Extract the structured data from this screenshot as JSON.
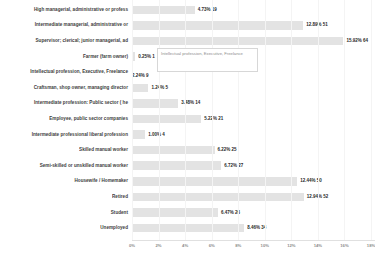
{
  "chart_data": {
    "type": "bar",
    "orientation": "horizontal",
    "title": "",
    "xlabel": "",
    "ylabel": "",
    "xlim": [
      0,
      18
    ],
    "grid": true,
    "legend": null,
    "tick_labels": [
      "0%",
      "2%",
      "4%",
      "6%",
      "8%",
      "10%",
      "12%",
      "14%",
      "16%",
      "18%"
    ],
    "tick_values": [
      0,
      2,
      4,
      6,
      8,
      10,
      12,
      14,
      16,
      18
    ],
    "categories": [
      "High managerial, administrative or profess",
      "Intermediate managerial, administrative or",
      "Supervisor; clerical; junior managerial, ad",
      "Farmer (farm owner)",
      "Intellectual profession, Executive, Freelance",
      "Craftsman, shop owner, managing director",
      "Intermediate profession: Public sector ( he",
      "Employee, public sector companies",
      "Intermediate professional liberal profession",
      "Skilled manual worker",
      "Semi-skilled or unskilled manual worker",
      "Housewife / Homemaker",
      "Retired",
      "Student",
      "Unemployed"
    ],
    "values": [
      4.73,
      12.89,
      15.92,
      0.25,
      2.24,
      1.24,
      3.48,
      5.22,
      1.0,
      6.22,
      6.72,
      12.44,
      12.94,
      6.47,
      8.46
    ],
    "counts": [
      19,
      51,
      64,
      1,
      9,
      5,
      14,
      21,
      4,
      25,
      27,
      50,
      52,
      26,
      34
    ],
    "value_labels": [
      "4.73% 19",
      "12.89% 51",
      "15.92% 64",
      "0.25% 1",
      "2.24% 9",
      "1.24% 5",
      "3.48% 14",
      "5.22% 21",
      "1.00% 4",
      "6.22% 25",
      "6.72% 27",
      "12.44% 50",
      "12.94% 52",
      "6.47% 26",
      "8.46% 34"
    ],
    "bar_color": "#e3e3e3"
  },
  "tooltip": {
    "text": "Intellectual profession, Executive, Freelance"
  }
}
